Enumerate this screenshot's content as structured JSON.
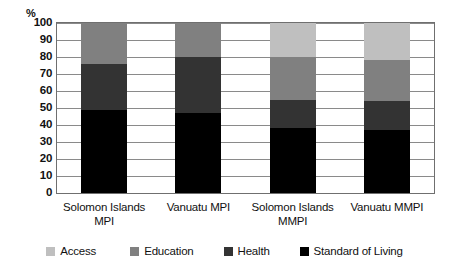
{
  "chart_data": {
    "type": "bar",
    "subtype": "stacked-bar-100",
    "title": "",
    "xlabel": "",
    "ylabel": "%",
    "ylim": [
      0,
      100
    ],
    "yticks": [
      0,
      10,
      20,
      30,
      40,
      50,
      60,
      70,
      80,
      90,
      100
    ],
    "ytick_labels": [
      "0",
      "10",
      "20",
      "30",
      "40",
      "50",
      "60",
      "70",
      "80",
      "90",
      "100"
    ],
    "grid": true,
    "legend_position": "bottom",
    "categories": [
      "Solomon Islands MPI",
      "Vanuatu MPI",
      "Solomon Islands MMPI",
      "Vanuatu MMPI"
    ],
    "category_lines": [
      [
        "Solomon Islands",
        "MPI"
      ],
      [
        "Vanuatu MPI"
      ],
      [
        "Solomon Islands",
        "MMPI"
      ],
      [
        "Vanuatu MMPI"
      ]
    ],
    "series": [
      {
        "name": "Standard of Living",
        "color": "#000000",
        "values": [
          49,
          47,
          38,
          37
        ]
      },
      {
        "name": "Health",
        "color": "#333333",
        "values": [
          27,
          33,
          17,
          17
        ]
      },
      {
        "name": "Education",
        "color": "#808080",
        "values": [
          24,
          20,
          25,
          24
        ]
      },
      {
        "name": "Access",
        "color": "#bfbfbf",
        "values": [
          0,
          0,
          20,
          22
        ]
      }
    ]
  },
  "legend": {
    "items": [
      {
        "label": "Access",
        "color": "#bfbfbf"
      },
      {
        "label": "Education",
        "color": "#808080"
      },
      {
        "label": "Health",
        "color": "#333333"
      },
      {
        "label": "Standard of Living",
        "color": "#000000"
      }
    ]
  },
  "axis": {
    "unit_label": "%"
  },
  "colors": {
    "access": "#bfbfbf",
    "education": "#808080",
    "health": "#333333",
    "standard_of_living": "#000000",
    "gridline": "#8a8a8a",
    "frame": "#6f6f6f",
    "background": "#ffffff",
    "text": "#111111"
  }
}
